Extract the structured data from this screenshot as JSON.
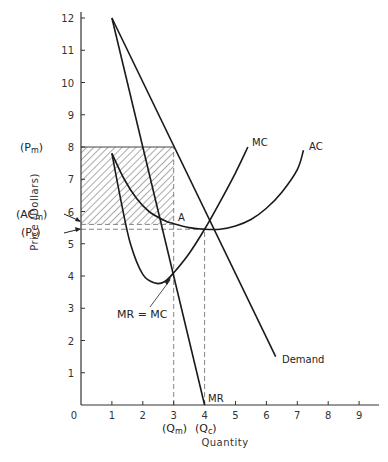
{
  "chart_data": {
    "type": "line",
    "title": "",
    "xlabel": "Quantity",
    "ylabel": "Price (Dollars)",
    "xlim": [
      0,
      9.5
    ],
    "ylim": [
      0,
      12.3
    ],
    "x_ticks": [
      0,
      1,
      2,
      3,
      4,
      5,
      6,
      7,
      8,
      9
    ],
    "y_ticks": [
      1,
      2,
      3,
      4,
      5,
      6,
      7,
      8,
      9,
      10,
      11,
      12
    ],
    "grid": false,
    "series": [
      {
        "name": "Demand",
        "style": "solid",
        "points": [
          [
            1,
            12
          ],
          [
            6.3,
            1.5
          ]
        ]
      },
      {
        "name": "MR",
        "style": "solid",
        "points": [
          [
            1,
            12
          ],
          [
            4,
            0
          ]
        ]
      },
      {
        "name": "MC",
        "style": "solid",
        "points": [
          [
            1,
            7.8
          ],
          [
            1.3,
            6.3
          ],
          [
            1.6,
            5.0
          ],
          [
            2.0,
            4.05
          ],
          [
            2.4,
            3.78
          ],
          [
            2.7,
            3.82
          ],
          [
            3.0,
            4.1
          ],
          [
            3.5,
            4.7
          ],
          [
            4.0,
            5.45
          ],
          [
            4.5,
            6.3
          ],
          [
            5.0,
            7.2
          ],
          [
            5.4,
            8.0
          ]
        ]
      },
      {
        "name": "AC",
        "style": "solid",
        "points": [
          [
            1,
            7.8
          ],
          [
            1.4,
            7.0
          ],
          [
            1.8,
            6.4
          ],
          [
            2.2,
            6.0
          ],
          [
            2.7,
            5.72
          ],
          [
            3.0,
            5.62
          ],
          [
            3.5,
            5.5
          ],
          [
            4.0,
            5.45
          ],
          [
            4.5,
            5.45
          ],
          [
            5.0,
            5.55
          ],
          [
            5.5,
            5.75
          ],
          [
            6.0,
            6.1
          ],
          [
            6.5,
            6.6
          ],
          [
            7.0,
            7.3
          ],
          [
            7.2,
            7.9
          ]
        ]
      }
    ],
    "reference_lines": [
      {
        "name": "Pm",
        "type": "horizontal",
        "y": 8,
        "x_from": 0,
        "x_to": 3
      },
      {
        "name": "ACm",
        "type": "horizontal",
        "y": 5.6,
        "x_from": 0,
        "x_to": 3
      },
      {
        "name": "Pc",
        "type": "horizontal",
        "y": 5.45,
        "x_from": 0,
        "x_to": 4
      },
      {
        "name": "Qm",
        "type": "vertical",
        "x": 3,
        "y_from": 0,
        "y_to": 8
      },
      {
        "name": "Qc",
        "type": "vertical",
        "x": 4,
        "y_from": 0,
        "y_to": 5.45
      }
    ],
    "shaded_region": {
      "name": "monopoly profit",
      "x": [
        0,
        3
      ],
      "y": [
        5.6,
        8
      ],
      "pattern": "diagonal-hatch"
    },
    "points": [
      {
        "label": "A",
        "x": 3,
        "y": 5.6
      },
      {
        "label": "MR = MC",
        "x": 3,
        "y": 4.1
      }
    ]
  },
  "labels": {
    "y_axis_title": "Price (Dollars)",
    "x_axis_title": "Quantity",
    "pm": "(Pm)",
    "pm_main": "(P",
    "pm_sub": "m",
    "acm_main": "(AC",
    "acm_sub": "m",
    "pc_main": "(P",
    "pc_sub": "c",
    "qm_main": "(Q",
    "qm_sub": "m",
    "qc_main": "(Q",
    "qc_sub": "c",
    "close_paren": ")",
    "mc": "MC",
    "ac": "AC",
    "demand": "Demand",
    "mr": "MR",
    "mr_eq_mc": "MR = MC",
    "point_a": "A"
  }
}
